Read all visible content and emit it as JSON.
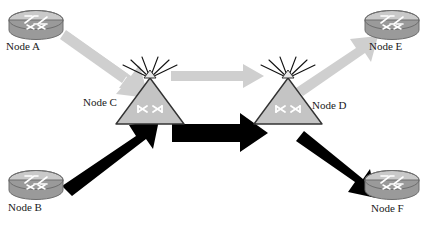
{
  "diagram": {
    "background_color": "#ffffff",
    "colors": {
      "gray_arrow": "#cfcfcf",
      "black_arrow": "#000000",
      "router_body": "#9a9a9a",
      "router_top": "#c9c9c9",
      "router_outline": "#6e6e6e",
      "triangle_fill": "#c4c4c4",
      "triangle_outline": "#333333",
      "antenna": "#111111",
      "label_text": "#1a1a1a"
    },
    "nodes": [
      {
        "id": "A",
        "label": "Node A",
        "type": "router-icon",
        "x": 36,
        "y": 25
      },
      {
        "id": "B",
        "label": "Node B",
        "type": "router-icon",
        "x": 36,
        "y": 185
      },
      {
        "id": "C",
        "label": "Node C",
        "type": "wireless-icon",
        "x": 150,
        "y": 100
      },
      {
        "id": "D",
        "label": "Node D",
        "type": "wireless-icon",
        "x": 288,
        "y": 100
      },
      {
        "id": "E",
        "label": "Node E",
        "type": "router-icon",
        "x": 392,
        "y": 25
      },
      {
        "id": "F",
        "label": "Node F",
        "type": "router-icon",
        "x": 392,
        "y": 185
      }
    ],
    "links": [
      {
        "id": "a-to-c",
        "from": "A",
        "to": "C",
        "style": "gray",
        "direction": "down-right"
      },
      {
        "id": "c-to-d",
        "from": "C",
        "to": "D",
        "style": "gray",
        "direction": "right"
      },
      {
        "id": "d-to-e",
        "from": "D",
        "to": "E",
        "style": "gray",
        "direction": "up-right"
      },
      {
        "id": "b-to-c",
        "from": "B",
        "to": "C",
        "style": "black",
        "direction": "up-right"
      },
      {
        "id": "c2-to-d",
        "from": "C",
        "to": "D",
        "style": "black",
        "direction": "right"
      },
      {
        "id": "d-to-f",
        "from": "D",
        "to": "F",
        "style": "black",
        "direction": "down-right"
      }
    ],
    "icons": {
      "router": "router-icon",
      "wireless": "wireless-triangle-icon",
      "arrow_gray": "gray-arrow-icon",
      "arrow_black": "black-arrow-icon"
    }
  }
}
